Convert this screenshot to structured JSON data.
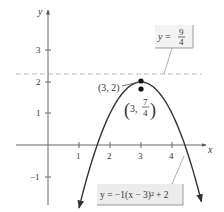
{
  "chart_data": {
    "type": "line",
    "title": "",
    "xlabel": "x",
    "ylabel": "y",
    "xlim": [
      -1.0,
      5.3
    ],
    "ylim": [
      -2.1,
      4.2
    ],
    "grid": false,
    "x_ticks": [
      1,
      2,
      3,
      4
    ],
    "y_ticks": [
      -1,
      1,
      2,
      3
    ],
    "series": [
      {
        "name": "y = -1(x - 3)^2 + 2",
        "function": "-(x-3)^2+2",
        "x_range": [
          1.0,
          4.95
        ],
        "color": "#333333"
      }
    ],
    "reference_lines": [
      {
        "type": "horizontal",
        "y": 2.25,
        "label": "y = 9/4",
        "style": "dashed",
        "color": "#bbbbbb"
      }
    ],
    "points": [
      {
        "x": 3,
        "y": 2,
        "label": "(3, 2)"
      },
      {
        "x": 3,
        "y": 1.75,
        "label": "(3, 7/4)"
      }
    ],
    "annotations": {
      "horizontal_line_label": {
        "lhs": "y =",
        "num": "9",
        "den": "4"
      },
      "equation_label": "y = −1(x − 3)² + 2",
      "vertex_label": "(3, 2)",
      "point_label_prefix": "3,",
      "point_label_num": "7",
      "point_label_den": "4"
    }
  },
  "axes": {
    "x_label": "x",
    "y_label": "y",
    "x_tick_labels": [
      "1",
      "2",
      "3",
      "4"
    ],
    "y_tick_labels": [
      "3",
      "2",
      "1",
      "−1"
    ]
  }
}
